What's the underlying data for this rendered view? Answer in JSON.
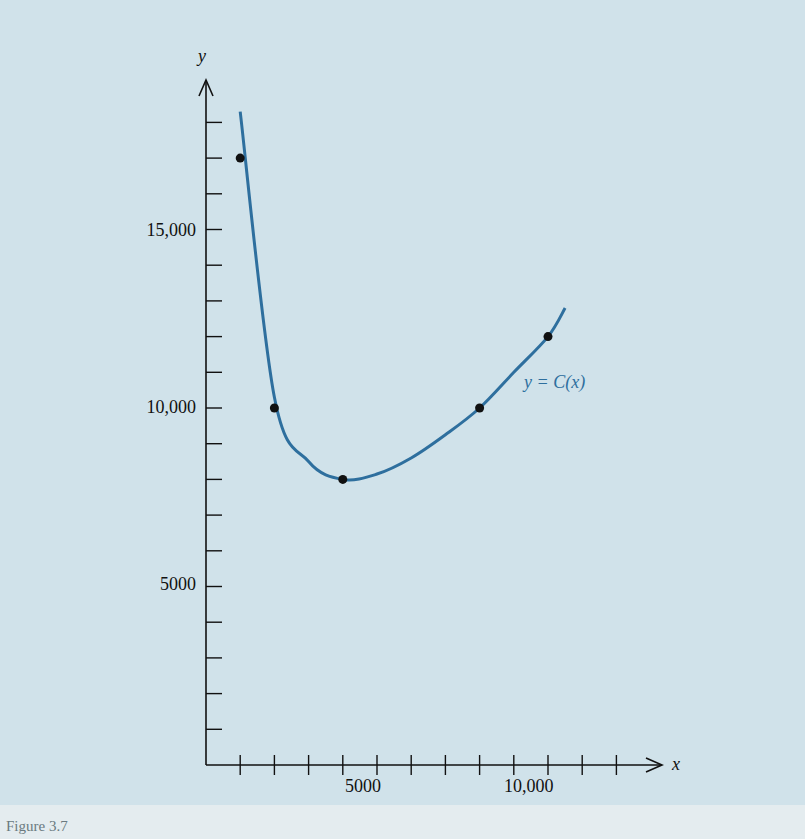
{
  "figure": {
    "caption": "Figure 3.7"
  },
  "chart_data": {
    "type": "line",
    "title": "",
    "xlabel": "x",
    "ylabel": "y",
    "x_ticks": [
      "5000",
      "10,000"
    ],
    "y_ticks": [
      "5000",
      "10,000",
      "15,000"
    ],
    "xlim": [
      0,
      12500
    ],
    "ylim": [
      0,
      18500
    ],
    "grid": false,
    "legend": null,
    "series": [
      {
        "name": "y = C(x)",
        "color": "#2e6f9e",
        "x": [
          1000,
          2000,
          3000,
          4000,
          5000,
          6000,
          7000,
          8000,
          9000,
          10000,
          10500
        ],
        "y": [
          18300,
          10300,
          8500,
          8000,
          8150,
          8600,
          9250,
          10000,
          11000,
          12000,
          12800
        ]
      }
    ],
    "points": {
      "x": [
        1000,
        2000,
        4000,
        8000,
        10000
      ],
      "y": [
        17000,
        10000,
        8000,
        10000,
        12000
      ]
    },
    "annotations": [
      {
        "text": "y = C(x)",
        "x": 8500,
        "y": 10700
      }
    ]
  },
  "labels": {
    "x_axis": "x",
    "y_axis": "y",
    "curve": "y = C(x)",
    "x_tick_5000": "5000",
    "x_tick_10000": "10,000",
    "y_tick_5000": "5000",
    "y_tick_10000": "10,000",
    "y_tick_15000": "15,000"
  }
}
